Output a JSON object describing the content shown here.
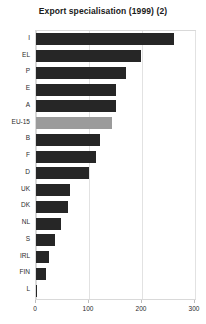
{
  "chart_data": {
    "type": "bar",
    "orientation": "horizontal",
    "title": "Export specialisation (1999) (2)",
    "xlabel": "",
    "ylabel": "",
    "xlim": [
      0,
      300
    ],
    "xticks": [
      0,
      100,
      200,
      300
    ],
    "grid": true,
    "legend": "none",
    "highlight_category": "EU-15",
    "colors": {
      "bar": "#262626",
      "bar_highlight": "#9b9b9b",
      "frame": "#d9d9d9",
      "gridline": "#e2e2e2",
      "text": "#2b2b2b",
      "title": "#1a1a1a",
      "background": "#ffffff"
    },
    "categories": [
      "I",
      "EL",
      "P",
      "E",
      "A",
      "EU-15",
      "B",
      "F",
      "D",
      "UK",
      "DK",
      "NL",
      "S",
      "IRL",
      "FIN",
      "L"
    ],
    "values": [
      261,
      198,
      170,
      151,
      150,
      143,
      120,
      114,
      100,
      65,
      60,
      47,
      35,
      24,
      18,
      2
    ]
  }
}
